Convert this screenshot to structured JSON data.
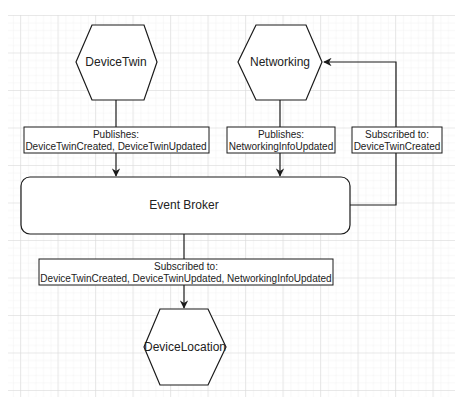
{
  "diagram": {
    "nodes": {
      "device_twin": {
        "label": "DeviceTwin",
        "shape": "hexagon"
      },
      "networking": {
        "label": "Networking",
        "shape": "hexagon"
      },
      "event_broker": {
        "label": "Event Broker",
        "shape": "rounded-rectangle"
      },
      "device_location": {
        "label": "DeviceLocation",
        "shape": "hexagon"
      }
    },
    "edges": {
      "device_twin_publish": {
        "from": "DeviceTwin",
        "to": "Event Broker",
        "line1": "Publishes:",
        "line2": "DeviceTwinCreated, DeviceTwinUpdated"
      },
      "networking_publish": {
        "from": "Networking",
        "to": "Event Broker",
        "line1": "Publishes:",
        "line2": "NetworkingInfoUpdated"
      },
      "networking_subscribe": {
        "from": "Event Broker",
        "to": "Networking",
        "line1": "Subscribed to:",
        "line2": "DeviceTwinCreated"
      },
      "device_location_subscribe": {
        "from": "Event Broker",
        "to": "DeviceLocation",
        "line1": "Subscribed to:",
        "line2": "DeviceTwinCreated, DeviceTwinUpdated, NetworkingInfoUpdated"
      }
    },
    "colors": {
      "stroke": "#1a1a1a",
      "grid_minor": "#ececec",
      "grid_major": "#d6d6d6",
      "background": "#ffffff"
    }
  }
}
